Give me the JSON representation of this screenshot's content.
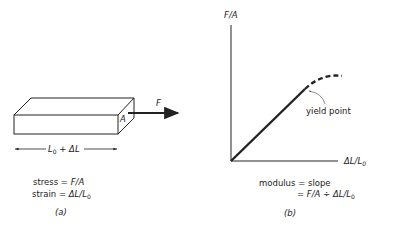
{
  "panel_a": {
    "force_label": "F",
    "area_label": "A",
    "length_label_main": "L",
    "length_label_sub": "0",
    "length_label_rest": " + ΔL",
    "stress_prefix": "stress = ",
    "stress_expr": "F/A",
    "strain_prefix": "strain = ",
    "strain_expr": "ΔL/L",
    "strain_sub": "0",
    "caption": "(a)"
  },
  "panel_b": {
    "y_axis_label": "F/A",
    "x_axis_label": "ΔL/L",
    "x_axis_label_sub": "0",
    "yield_label": "yield point",
    "modulus_line1": "modulus = slope",
    "modulus_line2_prefix": "= ",
    "modulus_line2_expr": "F/A ÷ ΔL/L",
    "modulus_line2_sub": "0",
    "caption": "(b)"
  },
  "colors": {
    "ink": "#222222",
    "background": "#ffffff"
  }
}
